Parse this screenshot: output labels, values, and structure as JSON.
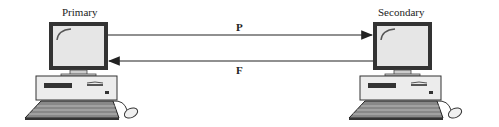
{
  "diagram": {
    "nodes": [
      {
        "id": "primary",
        "label": "Primary"
      },
      {
        "id": "secondary",
        "label": "Secondary"
      }
    ],
    "edges": [
      {
        "from": "primary",
        "to": "secondary",
        "label": "P"
      },
      {
        "from": "secondary",
        "to": "primary",
        "label": "F"
      }
    ]
  }
}
